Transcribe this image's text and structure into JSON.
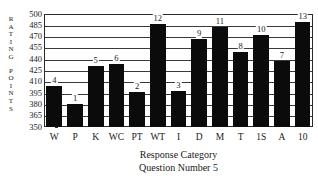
{
  "chart_data": {
    "type": "bar",
    "title": "",
    "xlabel": "Response Category",
    "sublabel": "Question Number 5",
    "ylabel": "RATING POINTS",
    "ylabel_letters": [
      "R",
      "A",
      "T",
      "I",
      "N",
      "G",
      "",
      "P",
      "O",
      "I",
      "N",
      "T",
      "S"
    ],
    "categories": [
      "W",
      "P",
      "K",
      "WC",
      "PT",
      "WT",
      "I",
      "D",
      "M",
      "T",
      "1S",
      "A",
      "10"
    ],
    "values": [
      404,
      381,
      431,
      434,
      397,
      487,
      398,
      467,
      483,
      449,
      472,
      437,
      489
    ],
    "point_labels": [
      "4",
      "1",
      "5",
      "6",
      "2",
      "12",
      "3",
      "9",
      "11",
      "8",
      "10",
      "7",
      "13"
    ],
    "ylim": [
      350,
      500
    ],
    "yticks": [
      350,
      365,
      380,
      395,
      410,
      425,
      440,
      455,
      470,
      485,
      500
    ],
    "ytick_labels": [
      "350",
      "365",
      "380",
      "395",
      "410",
      "425",
      "440",
      "455",
      "470",
      "485",
      "500"
    ],
    "grid": true,
    "legend": null,
    "bar_color": "#0b0b0b",
    "axis_color": "#2a2a2a",
    "background": "#ffffff"
  }
}
